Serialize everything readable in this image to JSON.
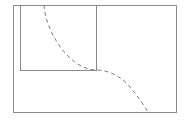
{
  "figure": {
    "background_color": "#ffffff",
    "width": 185,
    "height": 122
  },
  "style": {
    "rect_stroke_color": "#8a8a8a",
    "curve_stroke_color": "#7d7d7d",
    "rect_stroke_width": 1,
    "curve_stroke_width": 1,
    "curve_dash_pattern": "4,3"
  },
  "shapes": {
    "outer_rectangle": {
      "name": "outer-rectangle",
      "x": 13,
      "y": 5,
      "width": 163,
      "height": 107,
      "stroke": "#8a8a8a",
      "fill": "none",
      "style": "solid"
    },
    "inner_rectangle": {
      "name": "inner-rectangle",
      "x": 20,
      "y": 5,
      "width": 76,
      "height": 65,
      "stroke": "#8a8a8a",
      "fill": "none",
      "style": "solid"
    },
    "dashed_curve": {
      "name": "dashed-boundary-curve",
      "style": "dashed",
      "stroke": "#7d7d7d",
      "dash": "4,3",
      "start_point": [
        44,
        5
      ],
      "corner_point": [
        96,
        70
      ],
      "end_point": [
        148,
        112
      ],
      "path": "M 44 5 C 45 24 58 50 76 63 C 84 68 90 70 96 70 C 112 70 126 80 134 92 C 141 101 145 107 148 112"
    }
  }
}
